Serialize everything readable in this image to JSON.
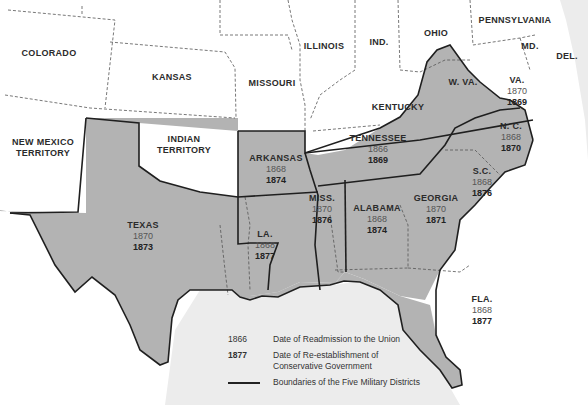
{
  "map": {
    "title": "Reconstruction in the South",
    "colors": {
      "confederate_fill": "#b3b3b3",
      "other_fill": "#ffffff",
      "water": "#ececec",
      "boundary": "#1f1f1f",
      "state_line": "#555555"
    },
    "unshaded_states": [
      {
        "id": "colorado",
        "name": "COLORADO"
      },
      {
        "id": "kansas",
        "name": "KANSAS"
      },
      {
        "id": "missouri",
        "name": "MISSOURI"
      },
      {
        "id": "illinois",
        "name": "ILLINOIS"
      },
      {
        "id": "indiana",
        "name": "IND."
      },
      {
        "id": "ohio",
        "name": "OHIO"
      },
      {
        "id": "pennsylvania",
        "name": "PENNSYLVANIA"
      },
      {
        "id": "maryland",
        "name": "MD."
      },
      {
        "id": "delaware",
        "name": "DEL."
      },
      {
        "id": "west_virginia",
        "name": "W. VA."
      },
      {
        "id": "kentucky",
        "name": "KENTUCKY"
      },
      {
        "id": "new_mexico",
        "name": "NEW MEXICO",
        "name2": "TERRITORY"
      },
      {
        "id": "indian_territory",
        "name": "INDIAN",
        "name2": "TERRITORY"
      }
    ],
    "confederate_states": [
      {
        "id": "virginia",
        "name": "VA.",
        "readmitted": "1870",
        "conservative": "1869"
      },
      {
        "id": "north_carolina",
        "name": "N. C.",
        "readmitted": "1868",
        "conservative": "1870"
      },
      {
        "id": "south_carolina",
        "name": "S.C.",
        "readmitted": "1868",
        "conservative": "1876"
      },
      {
        "id": "georgia",
        "name": "GEORGIA",
        "readmitted": "1870",
        "conservative": "1871"
      },
      {
        "id": "florida",
        "name": "FLA.",
        "readmitted": "1868",
        "conservative": "1877"
      },
      {
        "id": "alabama",
        "name": "ALABAMA",
        "readmitted": "1868",
        "conservative": "1874"
      },
      {
        "id": "mississippi",
        "name": "MISS.",
        "readmitted": "1870",
        "conservative": "1876"
      },
      {
        "id": "louisiana",
        "name": "LA.",
        "readmitted": "1868",
        "conservative": "1877"
      },
      {
        "id": "arkansas",
        "name": "ARKANSAS",
        "readmitted": "1868",
        "conservative": "1874"
      },
      {
        "id": "tennessee",
        "name": "TENNESSEE",
        "readmitted": "1866",
        "conservative": "1869"
      },
      {
        "id": "texas",
        "name": "TEXAS",
        "readmitted": "1870",
        "conservative": "1873"
      }
    ]
  },
  "legend": {
    "readmission": {
      "key": "1866",
      "text": "Date of Readmission to the Union"
    },
    "conservative": {
      "key": "1877",
      "text": "Date of Re-establishment of Conservative Government"
    },
    "districts": {
      "text": "Boundaries of the Five Military Districts"
    }
  }
}
